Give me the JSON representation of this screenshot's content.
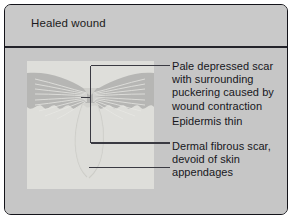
{
  "figure": {
    "title": "Healed wound",
    "frame_color": "#14141a",
    "background_color": "#c6c6c6",
    "panel_color": "#dededa",
    "tissue_color": "#b4b4b4",
    "leader_color": "#3a3a42",
    "text_color": "#17171c"
  },
  "annotations": [
    {
      "id": "pale-depressed-scar",
      "text": "Pale depressed scar\nwith surrounding\npuckering caused by\nwound contraction"
    },
    {
      "id": "epidermis-thin",
      "text": "Epidermis thin"
    },
    {
      "id": "dermal-fibrous-scar",
      "text": "Dermal fibrous scar,\ndevoid of skin\nappendages"
    }
  ],
  "illustration": {
    "name": "healed-wound-cross-section",
    "parts": [
      {
        "id": "dermis-panel",
        "label": "Dermis"
      },
      {
        "id": "epidermis-band",
        "label": "Epidermis"
      },
      {
        "id": "scar-fibers",
        "label": "Puckered scar fibres"
      },
      {
        "id": "dermal-scar-tract",
        "label": "Dermal fibrous scar tract"
      }
    ]
  }
}
